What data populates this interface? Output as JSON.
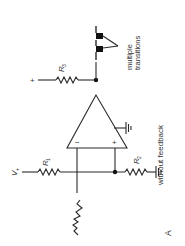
{
  "diagram": {
    "type": "op-amp comparator schematic (rotated 90°)",
    "panel_label": "A",
    "caption": "without feedback",
    "annotation": "multiple transitions",
    "annotation_lines": [
      "multiple",
      "transitions"
    ],
    "components": {
      "r1": {
        "label": "R",
        "sub": "1"
      },
      "r2": {
        "label": "R",
        "sub": "2"
      },
      "r3": {
        "label": "R",
        "sub": "3"
      },
      "vplus": {
        "label": "V",
        "sub": "+"
      },
      "supply_plus": "+",
      "opamp_inverting": "−",
      "opamp_noninverting": "+"
    },
    "colors": {
      "ink": "#2a2a2a",
      "background": "#ffffff"
    }
  }
}
